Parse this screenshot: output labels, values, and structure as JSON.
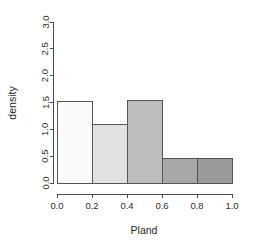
{
  "chart_data": {
    "type": "bar",
    "subtype": "histogram",
    "title": "",
    "xlabel": "Pland",
    "ylabel": "density",
    "xlim": [
      0.0,
      1.0
    ],
    "ylim": [
      0.0,
      3.0
    ],
    "grid": false,
    "legend": null,
    "bin_width": 0.2,
    "categories": [
      "0.0-0.2",
      "0.2-0.4",
      "0.4-0.6",
      "0.6-0.8",
      "0.8-1.0"
    ],
    "bin_edges": [
      0.0,
      0.2,
      0.4,
      0.6,
      0.8,
      1.0
    ],
    "values": [
      1.52,
      1.09,
      1.53,
      0.45,
      0.45
    ],
    "bar_colors": [
      "#fafafa",
      "#e2e2e2",
      "#bdbdbd",
      "#a8a8a8",
      "#9a9a9a"
    ],
    "bar_border_color": "#555555",
    "xticks": [
      0.0,
      0.2,
      0.4,
      0.6,
      0.8,
      1.0
    ],
    "xtick_labels": [
      "0.0",
      "0.2",
      "0.4",
      "0.6",
      "0.8",
      "1.0"
    ],
    "yticks": [
      0.0,
      0.5,
      1.0,
      1.5,
      2.0,
      2.5,
      3.0
    ],
    "ytick_labels": [
      "0.0",
      "0.5",
      "1.0",
      "1.5",
      "2.0",
      "2.5",
      "3.0"
    ],
    "axis_color": "#4d4d4d"
  }
}
